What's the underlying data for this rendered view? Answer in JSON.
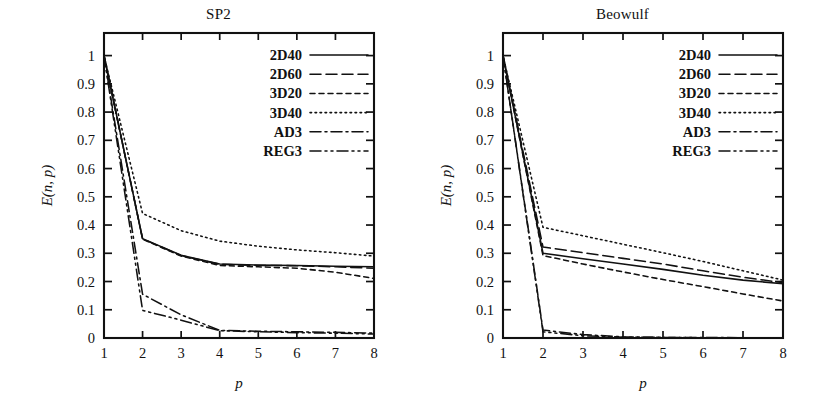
{
  "figure": {
    "background": "#ffffff",
    "ink_color": "#111111"
  },
  "chart_data": [
    {
      "type": "line",
      "title": "SP2",
      "xlabel": "p",
      "ylabel": "E(n, p)",
      "xlim": [
        1,
        8
      ],
      "ylim": [
        0,
        1.08
      ],
      "x": [
        1,
        2,
        3,
        4,
        5,
        6,
        7,
        8
      ],
      "xticks": [
        "1",
        "2",
        "3",
        "4",
        "5",
        "6",
        "7",
        "8"
      ],
      "yticks": [
        "0",
        "0.1",
        "0.2",
        "0.3",
        "0.4",
        "0.5",
        "0.6",
        "0.7",
        "0.8",
        "0.9",
        "1"
      ],
      "ytickvalues": [
        0,
        0.1,
        0.2,
        0.3,
        0.4,
        0.5,
        0.6,
        0.7,
        0.8,
        0.9,
        1
      ],
      "grid": false,
      "legend_position": "top-right",
      "series": [
        {
          "name": "2D40",
          "dash": "none",
          "values": [
            1.0,
            0.352,
            0.293,
            0.262,
            0.258,
            0.257,
            0.254,
            0.252
          ]
        },
        {
          "name": "2D60",
          "dash": "long-dash",
          "values": [
            1.0,
            0.351,
            0.292,
            0.261,
            0.257,
            0.256,
            0.252,
            0.247
          ]
        },
        {
          "name": "3D20",
          "dash": "short-dash",
          "values": [
            1.0,
            0.35,
            0.29,
            0.257,
            0.252,
            0.247,
            0.233,
            0.211
          ]
        },
        {
          "name": "3D40",
          "dash": "dotted",
          "values": [
            1.0,
            0.441,
            0.38,
            0.343,
            0.325,
            0.312,
            0.302,
            0.29
          ]
        },
        {
          "name": "AD3",
          "dash": "dash-dot",
          "values": [
            1.0,
            0.155,
            0.082,
            0.027,
            0.024,
            0.022,
            0.02,
            0.017
          ]
        },
        {
          "name": "REG3",
          "dash": "dash-dot-dot",
          "values": [
            1.0,
            0.098,
            0.063,
            0.026,
            0.022,
            0.019,
            0.017,
            0.014
          ]
        }
      ]
    },
    {
      "type": "line",
      "title": "Beowulf",
      "xlabel": "p",
      "ylabel": "E(n, p)",
      "xlim": [
        1,
        8
      ],
      "ylim": [
        0,
        1.08
      ],
      "x": [
        1,
        2,
        3,
        4,
        5,
        6,
        7,
        8
      ],
      "xticks": [
        "1",
        "2",
        "3",
        "4",
        "5",
        "6",
        "7",
        "8"
      ],
      "yticks": [
        "0",
        "0.1",
        "0.2",
        "0.3",
        "0.4",
        "0.5",
        "0.6",
        "0.7",
        "0.8",
        "0.9",
        "1"
      ],
      "ytickvalues": [
        0,
        0.1,
        0.2,
        0.3,
        0.4,
        0.5,
        0.6,
        0.7,
        0.8,
        0.9,
        1
      ],
      "grid": false,
      "legend_position": "top-right",
      "series": [
        {
          "name": "2D40",
          "dash": "none",
          "values": [
            1.0,
            0.3,
            0.281,
            0.262,
            0.243,
            0.222,
            0.205,
            0.192
          ]
        },
        {
          "name": "2D60",
          "dash": "long-dash",
          "values": [
            1.0,
            0.322,
            0.302,
            0.282,
            0.262,
            0.238,
            0.215,
            0.196
          ]
        },
        {
          "name": "3D20",
          "dash": "short-dash",
          "values": [
            1.0,
            0.292,
            0.262,
            0.234,
            0.207,
            0.182,
            0.156,
            0.131
          ]
        },
        {
          "name": "3D40",
          "dash": "dotted",
          "values": [
            1.0,
            0.392,
            0.362,
            0.332,
            0.302,
            0.271,
            0.238,
            0.205
          ]
        },
        {
          "name": "AD3",
          "dash": "dash-dot",
          "values": [
            1.0,
            0.028,
            0.012,
            0.004,
            0.002,
            0.002,
            0.001,
            0.001
          ]
        },
        {
          "name": "REG3",
          "dash": "dash-dot-dot",
          "values": [
            1.0,
            0.022,
            0.008,
            0.003,
            0.002,
            0.001,
            0.001,
            0.001
          ]
        }
      ]
    }
  ],
  "legend": {
    "entries": [
      "2D40",
      "2D60",
      "3D20",
      "3D40",
      "AD3",
      "REG3"
    ]
  }
}
